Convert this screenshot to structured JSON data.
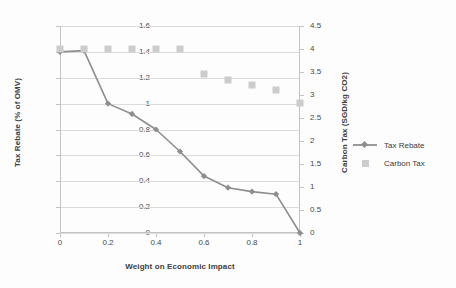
{
  "chart_data": {
    "type": "line",
    "title": "",
    "xlabel": "Weight on Economic Impact",
    "ylabel": "Tax Rebate (% of OMV)",
    "y2label": "Carbon Tax (SGD/kg CO2)",
    "x": [
      0,
      0.1,
      0.2,
      0.3,
      0.4,
      0.5,
      0.6,
      0.7,
      0.8,
      0.9,
      1
    ],
    "xlim": [
      0,
      1
    ],
    "ylim": [
      0,
      1.6
    ],
    "y2lim": [
      0,
      4.5
    ],
    "xticks": [
      "0",
      "0.2",
      "0.4",
      "0.6",
      "0.8",
      "1"
    ],
    "xtick_values": [
      0,
      0.2,
      0.4,
      0.6,
      0.8,
      1
    ],
    "yticks": [
      "0",
      "0.2",
      "0.4",
      "0.6",
      "0.8",
      "1",
      "1.2",
      "1.4",
      "1.6"
    ],
    "ytick_values": [
      0,
      0.2,
      0.4,
      0.6,
      0.8,
      1,
      1.2,
      1.4,
      1.6
    ],
    "y2ticks": [
      "0",
      "0.5",
      "1",
      "1.5",
      "2",
      "2.5",
      "3",
      "3.5",
      "4",
      "4.5"
    ],
    "y2tick_values": [
      0,
      0.5,
      1,
      1.5,
      2,
      2.5,
      3,
      3.5,
      4,
      4.5
    ],
    "grid": true,
    "legend_position": "right",
    "series": [
      {
        "name": "Tax Rebate",
        "axis": "left",
        "marker": "diamond",
        "color": "#8e8e8e",
        "values": [
          1.4,
          1.41,
          1.0,
          0.92,
          0.8,
          0.63,
          0.44,
          0.35,
          0.32,
          0.3,
          0
        ]
      },
      {
        "name": "Carbon Tax",
        "axis": "right",
        "marker": "square",
        "color": "#cccccc",
        "values": [
          4.0,
          4.0,
          4.0,
          4.0,
          4.0,
          4.0,
          3.45,
          3.33,
          3.22,
          3.1,
          2.83
        ]
      }
    ]
  },
  "legend": {
    "items": [
      {
        "label": "Tax Rebate",
        "marker": "line-diamond"
      },
      {
        "label": "Carbon Tax",
        "marker": "square"
      }
    ]
  },
  "colors": {
    "line": "#8e8e8e",
    "square": "#cccccc",
    "grid": "#dcdcdc",
    "axis": "#c3c3c3",
    "text": "#3b3b3b"
  }
}
